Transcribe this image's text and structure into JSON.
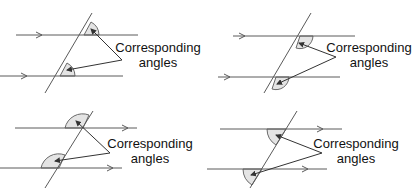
{
  "diagram": {
    "panels": [
      {
        "id": "top-left",
        "label_line1": "Corresponding",
        "label_line2": "angles"
      },
      {
        "id": "top-right",
        "label_line1": "Corresponding",
        "label_line2": "angles"
      },
      {
        "id": "bottom-left",
        "label_line1": "Corresponding",
        "label_line2": "angles"
      },
      {
        "id": "bottom-right",
        "label_line1": "Corresponding",
        "label_line2": "angles"
      }
    ],
    "colors": {
      "line": "#5a5a5a",
      "angle_fill": "#e4e4e4",
      "text": "#111111"
    }
  }
}
